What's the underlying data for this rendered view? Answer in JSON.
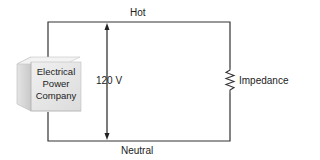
{
  "diagram": {
    "type": "circuit",
    "source": {
      "lines": [
        "Electrical",
        "Power",
        "Company"
      ]
    },
    "wires": {
      "top_label": "Hot",
      "bottom_label": "Neutral"
    },
    "voltage_label": "120 V",
    "load_label": "Impedance"
  },
  "colors": {
    "wire": "#333333",
    "cube_front": "#e6e6e6",
    "cube_top": "#f2f2f2",
    "cube_side": "#c8c8c8"
  }
}
